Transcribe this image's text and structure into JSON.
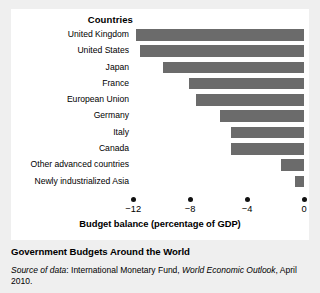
{
  "chart_data": {
    "type": "bar",
    "orientation": "horizontal",
    "title": "Countries",
    "xlabel": "Budget balance (percentage of GDP)",
    "ylabel": "",
    "xlim": [
      -13,
      0
    ],
    "xticks": [
      -12,
      -8,
      -4,
      0
    ],
    "xtick_labels": [
      "−12",
      "−8",
      "−4",
      "0"
    ],
    "grid": false,
    "legend": false,
    "bar_color": "#6b6b6b",
    "categories": [
      "United Kingdom",
      "United States",
      "Japan",
      "France",
      "European Union",
      "Germany",
      "Italy",
      "Canada",
      "Other advanced countries",
      "Newly industrialized Asia"
    ],
    "values": [
      -11.8,
      -11.5,
      -9.9,
      -8.1,
      -7.6,
      -5.9,
      -5.1,
      -5.1,
      -1.6,
      -0.6
    ]
  },
  "caption": {
    "figure_title": "Government Budgets Around the World",
    "source_prefix": "Source of data",
    "source_colon": ": International Monetary Fund, ",
    "source_publication": "World Economic Outlook",
    "source_suffix": ", April 2010."
  }
}
